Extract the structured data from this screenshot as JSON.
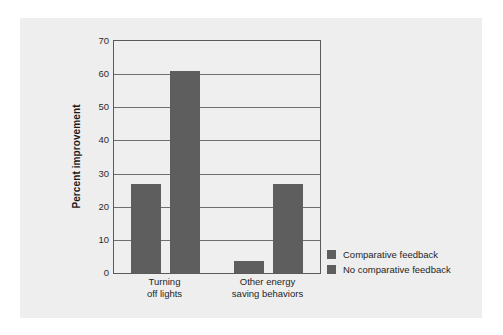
{
  "chart_data": {
    "type": "bar",
    "title": "",
    "xlabel": "",
    "ylabel": "Percent improvement",
    "ylim": [
      0,
      70
    ],
    "yticks": [
      0,
      10,
      20,
      30,
      40,
      50,
      60,
      70
    ],
    "ytick_labels": [
      "0",
      "10",
      "20",
      "30",
      "40",
      "50",
      "60",
      "70"
    ],
    "grid": true,
    "legend_position": "right",
    "categories": [
      "Turning\noff lights",
      "Other energy\nsaving behaviors"
    ],
    "series": [
      {
        "name": "Comparative feedback",
        "values": [
          27,
          3.5
        ],
        "color": "#5e5e5e"
      },
      {
        "name": "No comparative feedback",
        "values": [
          61,
          27
        ],
        "color": "#5e5e5e"
      }
    ]
  },
  "legend": {
    "items": [
      {
        "label": "Comparative feedback"
      },
      {
        "label": "No comparative feedback"
      }
    ]
  },
  "colors": {
    "bar": "#5e5e5e",
    "panel": "#eeeeee",
    "plot_bg": "#efefef",
    "axis": "#5a5a5a",
    "grid": "#6f6f6f",
    "text": "#1f1f1f"
  }
}
